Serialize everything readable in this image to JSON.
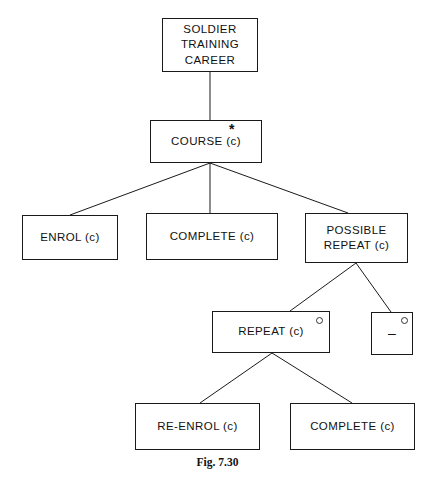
{
  "figure": {
    "caption": "Fig. 7.30",
    "type": "structure-chart",
    "line_color": "#1a1a1a",
    "background_color": "#ffffff"
  },
  "nodes": {
    "root": {
      "label": "SOLDIER\nTRAINING\nCAREER"
    },
    "course": {
      "label": "COURSE (c)",
      "marker": "*"
    },
    "enrol": {
      "label": "ENROL (c)"
    },
    "complete1": {
      "label": "COMPLETE (c)"
    },
    "possible_repeat": {
      "label": "POSSIBLE\nREPEAT (c)"
    },
    "repeat": {
      "label": "REPEAT (c)",
      "marker": "○"
    },
    "dash": {
      "label": "–",
      "marker": "○"
    },
    "reenrol": {
      "label": "RE-ENROL (c)"
    },
    "complete2": {
      "label": "COMPLETE (c)"
    }
  },
  "edges": [
    {
      "from": "root",
      "to": "course"
    },
    {
      "from": "course",
      "to": "enrol"
    },
    {
      "from": "course",
      "to": "complete1"
    },
    {
      "from": "course",
      "to": "possible_repeat"
    },
    {
      "from": "possible_repeat",
      "to": "repeat"
    },
    {
      "from": "possible_repeat",
      "to": "dash"
    },
    {
      "from": "repeat",
      "to": "reenrol"
    },
    {
      "from": "repeat",
      "to": "complete2"
    }
  ]
}
